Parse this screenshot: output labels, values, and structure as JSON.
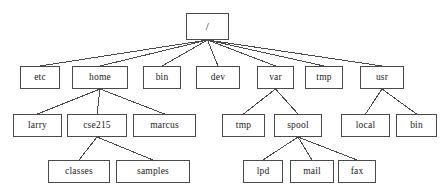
{
  "diagram": {
    "type": "tree",
    "style": {
      "background_color": "#ffffff",
      "box_fill": "#ffffff",
      "box_border_color": "#4a4a4a",
      "edge_color": "#4a4a4a",
      "text_color": "#1a1a1a"
    },
    "nodes": [
      {
        "id": "root",
        "label": "/",
        "level": 0,
        "x": 186,
        "y": 13,
        "w": 43,
        "h": 27,
        "parent": null
      },
      {
        "id": "etc",
        "label": "etc",
        "level": 1,
        "x": 20,
        "y": 66,
        "w": 40,
        "h": 23,
        "parent": "root"
      },
      {
        "id": "home",
        "label": "home",
        "level": 1,
        "x": 72,
        "y": 66,
        "w": 56,
        "h": 23,
        "parent": "root"
      },
      {
        "id": "bin1",
        "label": "bin",
        "level": 1,
        "x": 143,
        "y": 66,
        "w": 38,
        "h": 23,
        "parent": "root"
      },
      {
        "id": "dev",
        "label": "dev",
        "level": 1,
        "x": 196,
        "y": 66,
        "w": 44,
        "h": 23,
        "parent": "root"
      },
      {
        "id": "var",
        "label": "var",
        "level": 1,
        "x": 257,
        "y": 66,
        "w": 37,
        "h": 23,
        "parent": "root"
      },
      {
        "id": "tmp1",
        "label": "tmp",
        "level": 1,
        "x": 305,
        "y": 66,
        "w": 38,
        "h": 23,
        "parent": "root"
      },
      {
        "id": "usr",
        "label": "usr",
        "level": 1,
        "x": 360,
        "y": 66,
        "w": 44,
        "h": 23,
        "parent": "root"
      },
      {
        "id": "larry",
        "label": "larry",
        "level": 2,
        "x": 13,
        "y": 114,
        "w": 49,
        "h": 23,
        "parent": "home"
      },
      {
        "id": "cse215",
        "label": "cse215",
        "level": 2,
        "x": 67,
        "y": 114,
        "w": 60,
        "h": 23,
        "parent": "home"
      },
      {
        "id": "marcus",
        "label": "marcus",
        "level": 2,
        "x": 133,
        "y": 114,
        "w": 63,
        "h": 23,
        "parent": "home"
      },
      {
        "id": "tmp2",
        "label": "tmp",
        "level": 2,
        "x": 222,
        "y": 114,
        "w": 43,
        "h": 23,
        "parent": "var"
      },
      {
        "id": "spool",
        "label": "spool",
        "level": 2,
        "x": 274,
        "y": 114,
        "w": 48,
        "h": 23,
        "parent": "var"
      },
      {
        "id": "local",
        "label": "local",
        "level": 2,
        "x": 341,
        "y": 114,
        "w": 49,
        "h": 23,
        "parent": "usr"
      },
      {
        "id": "bin2",
        "label": "bin",
        "level": 2,
        "x": 396,
        "y": 114,
        "w": 41,
        "h": 23,
        "parent": "usr"
      },
      {
        "id": "classes",
        "label": "classes",
        "level": 3,
        "x": 48,
        "y": 160,
        "w": 62,
        "h": 23,
        "parent": "cse215"
      },
      {
        "id": "samples",
        "label": "samples",
        "level": 3,
        "x": 116,
        "y": 160,
        "w": 74,
        "h": 23,
        "parent": "cse215"
      },
      {
        "id": "lpd",
        "label": "lpd",
        "level": 3,
        "x": 243,
        "y": 160,
        "w": 40,
        "h": 23,
        "parent": "spool"
      },
      {
        "id": "mail",
        "label": "mail",
        "level": 3,
        "x": 290,
        "y": 160,
        "w": 44,
        "h": 23,
        "parent": "spool"
      },
      {
        "id": "fax",
        "label": "fax",
        "level": 3,
        "x": 338,
        "y": 160,
        "w": 38,
        "h": 23,
        "parent": "spool"
      }
    ],
    "edges": [
      {
        "from": "root",
        "to": "etc"
      },
      {
        "from": "root",
        "to": "home"
      },
      {
        "from": "root",
        "to": "bin1"
      },
      {
        "from": "root",
        "to": "dev"
      },
      {
        "from": "root",
        "to": "var"
      },
      {
        "from": "root",
        "to": "tmp1"
      },
      {
        "from": "root",
        "to": "usr"
      },
      {
        "from": "home",
        "to": "larry"
      },
      {
        "from": "home",
        "to": "cse215"
      },
      {
        "from": "home",
        "to": "marcus"
      },
      {
        "from": "var",
        "to": "tmp2"
      },
      {
        "from": "var",
        "to": "spool"
      },
      {
        "from": "usr",
        "to": "local"
      },
      {
        "from": "usr",
        "to": "bin2"
      },
      {
        "from": "cse215",
        "to": "classes"
      },
      {
        "from": "cse215",
        "to": "samples"
      },
      {
        "from": "spool",
        "to": "lpd"
      },
      {
        "from": "spool",
        "to": "mail"
      },
      {
        "from": "spool",
        "to": "fax"
      }
    ]
  }
}
